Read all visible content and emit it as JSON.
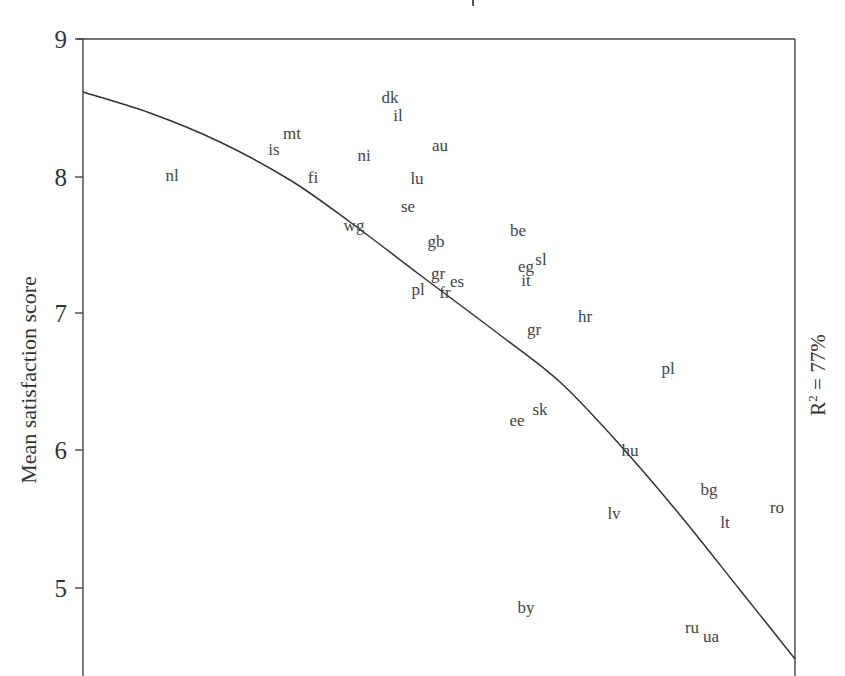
{
  "chart_data": {
    "type": "scatter",
    "title": "",
    "xlabel": "",
    "ylabel": "Mean satisfaction score",
    "ylim": [
      4.55,
      9.0
    ],
    "yticks": [
      5,
      6,
      7,
      8,
      9
    ],
    "grid": false,
    "legend": null,
    "annotation": {
      "label": "R",
      "superscript": "2",
      "text": " = 77%",
      "position": "right-margin-vertical"
    },
    "points": [
      {
        "label": "nl",
        "x": 172,
        "y": 8.0
      },
      {
        "label": "is",
        "x": 274,
        "y": 8.19
      },
      {
        "label": "mt",
        "x": 292,
        "y": 8.31
      },
      {
        "label": "fi",
        "x": 313,
        "y": 7.99
      },
      {
        "label": "ni",
        "x": 364,
        "y": 8.15
      },
      {
        "label": "dk",
        "x": 390,
        "y": 8.57
      },
      {
        "label": "il",
        "x": 398,
        "y": 8.44
      },
      {
        "label": "au",
        "x": 440,
        "y": 8.22
      },
      {
        "label": "lu",
        "x": 417,
        "y": 7.98
      },
      {
        "label": "se",
        "x": 408,
        "y": 7.78
      },
      {
        "label": "wg",
        "x": 354,
        "y": 7.64
      },
      {
        "label": "gb",
        "x": 436,
        "y": 7.52
      },
      {
        "label": "gr",
        "x": 438,
        "y": 7.29
      },
      {
        "label": "pl",
        "x": 418,
        "y": 7.17
      },
      {
        "label": "fr",
        "x": 445,
        "y": 7.15
      },
      {
        "label": "es",
        "x": 457,
        "y": 7.23
      },
      {
        "label": "be",
        "x": 518,
        "y": 7.6
      },
      {
        "label": "eg",
        "x": 526,
        "y": 7.34
      },
      {
        "label": "sl",
        "x": 541,
        "y": 7.39
      },
      {
        "label": "it",
        "x": 526,
        "y": 7.24
      },
      {
        "label": "gr",
        "x": 534,
        "y": 6.88
      },
      {
        "label": "hr",
        "x": 585,
        "y": 6.98
      },
      {
        "label": "pl",
        "x": 668,
        "y": 6.6
      },
      {
        "label": "ee",
        "x": 517,
        "y": 6.22
      },
      {
        "label": "sk",
        "x": 540,
        "y": 6.3
      },
      {
        "label": "hu",
        "x": 630,
        "y": 6.0
      },
      {
        "label": "bg",
        "x": 709,
        "y": 5.72
      },
      {
        "label": "lv",
        "x": 614,
        "y": 5.54
      },
      {
        "label": "lt",
        "x": 725,
        "y": 5.48
      },
      {
        "label": "ro",
        "x": 777,
        "y": 5.59
      },
      {
        "label": "by",
        "x": 526,
        "y": 4.86
      },
      {
        "label": "ru",
        "x": 692,
        "y": 4.71
      },
      {
        "label": "ua",
        "x": 711,
        "y": 4.65
      }
    ],
    "fit_curve": {
      "type": "quadratic",
      "points_px": [
        [
          83,
          92
        ],
        [
          150,
          113
        ],
        [
          220,
          142
        ],
        [
          290,
          180
        ],
        [
          350,
          222
        ],
        [
          420,
          275
        ],
        [
          500,
          335
        ],
        [
          560,
          382
        ],
        [
          620,
          445
        ],
        [
          680,
          515
        ],
        [
          740,
          590
        ],
        [
          795,
          659
        ]
      ],
      "y_start": 8.61,
      "y_end": 4.49,
      "r_squared": "77%"
    }
  },
  "axes": {
    "y_title": "Mean satisfaction score",
    "ticks": [
      "9",
      "8",
      "7",
      "6",
      "5"
    ]
  },
  "annotation": {
    "r": "R",
    "sup": "2",
    "rest": " = 77%"
  }
}
